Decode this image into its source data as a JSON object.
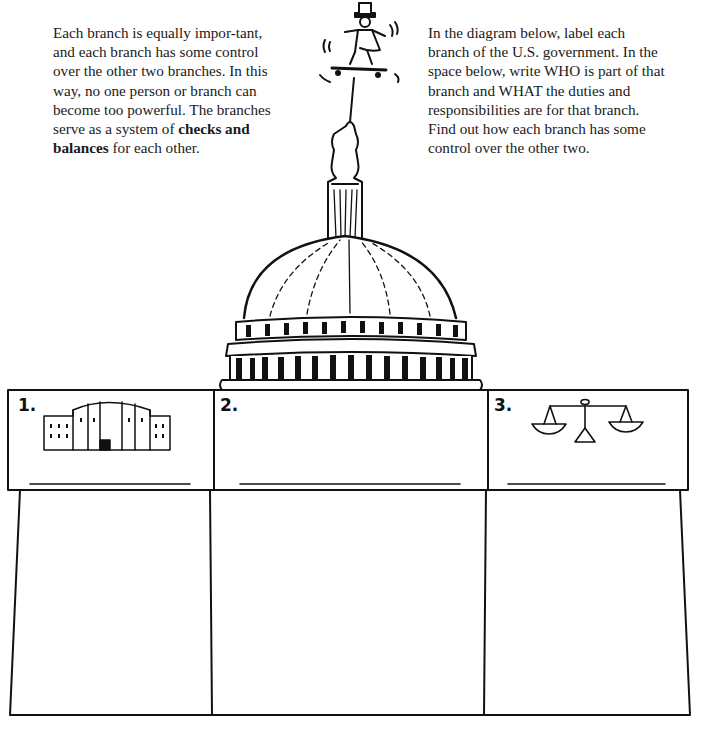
{
  "left_paragraph": {
    "text_before": "Each branch is equally impor-tant, and each branch has some control over the other two branches. In this way, no one person or branch can become too powerful. The branches serve as a system of ",
    "bold": "checks and balances",
    "text_after": " for each other."
  },
  "right_paragraph": {
    "text": "In the diagram below, label each branch of the U.S. government. In the space below, write WHO is part of that branch and WHAT the duties and responsibilities are for that branch. Find out how each branch has some control over the other two."
  },
  "illustration": {
    "top_figure": "uncle-sam-on-skateboard",
    "building": "capitol-dome"
  },
  "branches": [
    {
      "number": "1.",
      "icon": "white-house-icon",
      "label_value": "",
      "description_value": ""
    },
    {
      "number": "2.",
      "icon": "",
      "label_value": "",
      "description_value": ""
    },
    {
      "number": "3.",
      "icon": "scales-of-justice-icon",
      "label_value": "",
      "description_value": ""
    }
  ],
  "colors": {
    "ink": "#111111",
    "paper": "#ffffff"
  }
}
